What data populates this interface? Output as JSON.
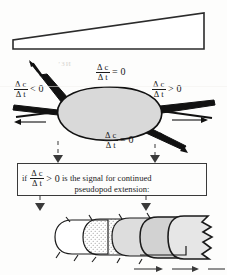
{
  "figure": {
    "panels": {
      "gradient_wedge": {
        "name": "chemical gradient wedge",
        "description": "Wedge shape increasing in height from left to right representing a chemoattractant concentration gradient"
      },
      "cell": {
        "name": "amoeboid cell with four pseudopods",
        "labels": {
          "top": {
            "numerator": "Δ c",
            "denominator": "Δ t",
            "relation": "= 0"
          },
          "left": {
            "numerator": "Δ c",
            "denominator": "Δ t",
            "relation": "< 0"
          },
          "right": {
            "numerator": "Δ c",
            "denominator": "Δ t",
            "relation": "> 0"
          },
          "bottom": {
            "numerator": "Δ c",
            "denominator": "Δ t",
            "relation": "= 0"
          }
        }
      },
      "condition_box": {
        "if_word": "if",
        "numerator": "Δ c",
        "denominator": "Δ t",
        "relation": "> 0",
        "line1_tail": "is the signal for continued",
        "line2": "pseudopod extension:"
      },
      "extension_sequence": {
        "name": "progressive pseudopod extension",
        "description": "Overlapping rounded cell outlines advancing to the right with ruffled leading edge"
      }
    },
    "artifact_text": "’ЗИ"
  },
  "colors": {
    "ink": "#1a1a1a",
    "paper": "#fdfdfc",
    "cell_fill": "#d9d9d9",
    "pseudopod_dark": "#111111",
    "box_border": "#3a3a3a",
    "stipple": "#8d8d8d"
  }
}
